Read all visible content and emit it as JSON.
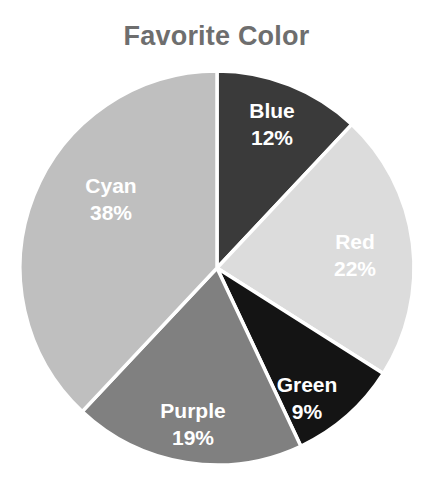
{
  "chart_data": {
    "type": "pie",
    "title": "Favorite Color",
    "xlabel": "",
    "ylabel": "",
    "legend": "none",
    "grid": false,
    "start_angle_deg": 90,
    "direction": "clockwise",
    "categories": [
      "Blue",
      "Red",
      "Green",
      "Purple",
      "Cyan"
    ],
    "values": [
      12,
      22,
      9,
      19,
      38
    ],
    "value_unit": "%",
    "slices": [
      {
        "label": "Blue",
        "value": 12,
        "value_text": "12%",
        "color": "#3a3a3a",
        "label_x": 272,
        "label_y": 112,
        "value_x": 272,
        "value_y": 139
      },
      {
        "label": "Red",
        "value": 22,
        "value_text": "22%",
        "color": "#dcdcdc",
        "label_x": 355,
        "label_y": 243,
        "value_x": 355,
        "value_y": 270
      },
      {
        "label": "Green",
        "value": 9,
        "value_text": "9%",
        "color": "#141414",
        "label_x": 307,
        "label_y": 386,
        "value_x": 307,
        "value_y": 413
      },
      {
        "label": "Purple",
        "value": 19,
        "value_text": "19%",
        "color": "#808080",
        "label_x": 193,
        "label_y": 412,
        "value_x": 193,
        "value_y": 439
      },
      {
        "label": "Cyan",
        "value": 38,
        "value_text": "38%",
        "color": "#bfbfbf",
        "label_x": 111,
        "label_y": 187,
        "value_x": 111,
        "value_y": 214
      }
    ],
    "geometry": {
      "center_x": 217,
      "center_y": 268,
      "radius": 197
    },
    "style": {
      "background": "#ffffff",
      "title_color": "#6e6e6e",
      "label_color": "#ffffff",
      "slice_border_color": "#ffffff"
    }
  }
}
